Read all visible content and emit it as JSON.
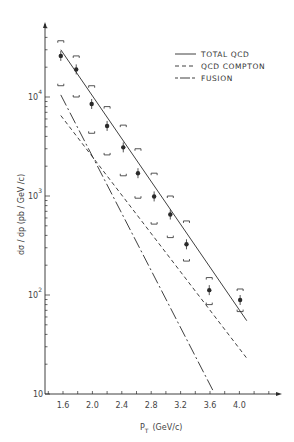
{
  "chart_data": {
    "type": "scatter",
    "title": "",
    "xlabel": "P_T (GeV/c)",
    "ylabel": "dσ / dp_T (pb / GeV / c)",
    "xscale": "linear",
    "yscale": "log",
    "xlim": [
      1.4,
      4.4
    ],
    "ylim": [
      10,
      60000
    ],
    "x_ticks": [
      "1.6",
      "2.0",
      "2.4",
      "2.8",
      "3.2",
      "3.6",
      "4.0"
    ],
    "y_ticks": [
      "10",
      "10^2",
      "10^3",
      "10^4"
    ],
    "grid": false,
    "legend_position": "upper right",
    "series": [
      {
        "name": "data",
        "kind": "points_with_error_brackets",
        "x": [
          1.57,
          1.78,
          1.99,
          2.2,
          2.42,
          2.62,
          2.84,
          3.06,
          3.28,
          3.59,
          4.01
        ],
        "y": [
          26000,
          19000,
          8500,
          5100,
          3100,
          1700,
          990,
          650,
          325,
          112,
          89
        ],
        "y_upper": [
          37000,
          26000,
          13000,
          8000,
          5200,
          3000,
          1700,
          1000,
          560,
          150,
          115
        ],
        "y_lower": [
          13000,
          10000,
          4300,
          2600,
          1600,
          950,
          520,
          380,
          220,
          80,
          68
        ]
      },
      {
        "name": "TOTAL QCD",
        "kind": "line",
        "style": "solid",
        "x": [
          1.57,
          4.1
        ],
        "y": [
          30000,
          55
        ]
      },
      {
        "name": "QCD COMPTON",
        "kind": "line",
        "style": "dashed",
        "x": [
          1.57,
          4.1
        ],
        "y": [
          6500,
          23
        ]
      },
      {
        "name": "FUSION",
        "kind": "line",
        "style": "dash-dot",
        "x": [
          1.57,
          3.65
        ],
        "y": [
          10500,
          10.5
        ]
      }
    ]
  },
  "legend": {
    "items": [
      {
        "label": "TOTAL QCD",
        "style": "solid"
      },
      {
        "label": "QCD COMPTON",
        "style": "dashed"
      },
      {
        "label": "FUSION",
        "style": "dash-dot"
      }
    ]
  },
  "axes": {
    "x_title_main": "P",
    "x_title_sub": "T",
    "x_title_unit": "(GeV/c)",
    "y_title": "dσ / dp  (pb / GeV /c)",
    "y_title_sub": "T",
    "x_ticks": [
      {
        "label": "1.6",
        "value": 1.6
      },
      {
        "label": "2.0",
        "value": 2.0
      },
      {
        "label": "2.4",
        "value": 2.4
      },
      {
        "label": "2.8",
        "value": 2.8
      },
      {
        "label": "3.2",
        "value": 3.2
      },
      {
        "label": "3.6",
        "value": 3.6
      },
      {
        "label": "4.0",
        "value": 4.0
      }
    ],
    "y_ticks": [
      {
        "base": "10",
        "exp": ""
      },
      {
        "base": "10",
        "exp": "2"
      },
      {
        "base": "10",
        "exp": "3"
      },
      {
        "base": "10",
        "exp": "4"
      }
    ]
  },
  "colors": {
    "ink": "#2a2a2a",
    "background": "#ffffff"
  }
}
